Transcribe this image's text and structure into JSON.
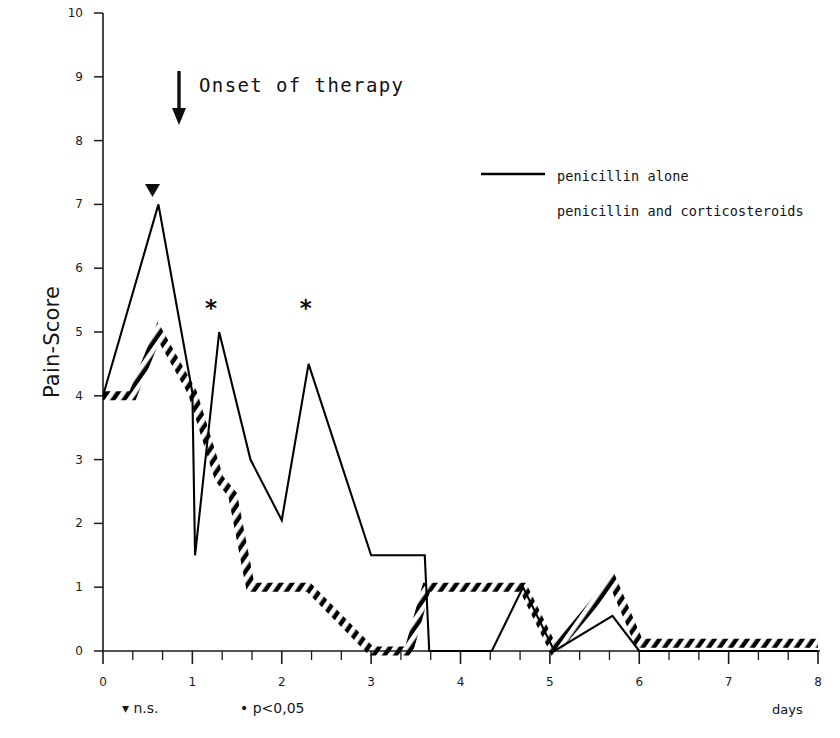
{
  "chart_data": {
    "type": "line",
    "title": "",
    "xlabel": "days",
    "ylabel": "Pain-Score",
    "xlim": [
      0,
      8
    ],
    "ylim": [
      0,
      10
    ],
    "grid": false,
    "legend_position": "upper-right",
    "x_ticks": [
      "0",
      "1",
      "2",
      "3",
      "4",
      "5",
      "6",
      "7",
      "8"
    ],
    "y_ticks": [
      "0",
      "1",
      "2",
      "3",
      "4",
      "5",
      "6",
      "7",
      "8",
      "9",
      "10"
    ],
    "x_minor_ticks_per_interval": 3,
    "series": [
      {
        "name": "penicillin alone",
        "style": "solid",
        "color": "#000000",
        "points": [
          [
            0.0,
            4.0
          ],
          [
            0.62,
            7.0
          ],
          [
            1.0,
            4.05
          ],
          [
            1.03,
            1.5
          ],
          [
            1.3,
            5.0
          ],
          [
            1.65,
            3.0
          ],
          [
            2.0,
            2.05
          ],
          [
            2.3,
            4.5
          ],
          [
            3.0,
            1.5
          ],
          [
            3.6,
            1.5
          ],
          [
            3.65,
            0.0
          ],
          [
            4.35,
            0.0
          ],
          [
            4.7,
            1.0
          ],
          [
            5.05,
            0.0
          ],
          [
            5.7,
            0.55
          ],
          [
            6.0,
            0.0
          ],
          [
            8.0,
            0.0
          ]
        ]
      },
      {
        "name": "penicillin and corticosteroids",
        "style": "hatched-dashed",
        "color": "#000000",
        "points": [
          [
            0.0,
            4.0
          ],
          [
            0.33,
            4.0
          ],
          [
            0.62,
            5.0
          ],
          [
            1.0,
            4.05
          ],
          [
            1.3,
            2.7
          ],
          [
            1.45,
            2.45
          ],
          [
            1.65,
            1.0
          ],
          [
            2.3,
            1.0
          ],
          [
            3.0,
            0.0
          ],
          [
            3.42,
            0.0
          ],
          [
            3.62,
            1.0
          ],
          [
            4.7,
            1.0
          ],
          [
            5.05,
            0.0
          ],
          [
            5.7,
            1.1
          ],
          [
            6.0,
            0.12
          ],
          [
            8.0,
            0.12
          ]
        ]
      }
    ],
    "annotations": [
      {
        "id": "onset",
        "text": "Onset of therapy",
        "icon": "down-arrow-icon",
        "x_day": 0.85,
        "y_score": 9.1
      },
      {
        "id": "ns-marker",
        "symbol": "▼",
        "x_day": 0.55,
        "y_score": 7.3,
        "meaning": "n.s."
      },
      {
        "id": "star-1",
        "symbol": "*",
        "x_day": 1.22,
        "y_score": 5.3,
        "meaning": "p<0,05"
      },
      {
        "id": "star-2",
        "symbol": "*",
        "x_day": 2.28,
        "y_score": 5.3,
        "meaning": "p<0,05"
      }
    ],
    "footnotes": [
      {
        "symbol": "▾",
        "text": "n.s."
      },
      {
        "symbol": "•",
        "text": "p<0,05"
      }
    ]
  },
  "legend": {
    "items": [
      {
        "label": "penicillin alone",
        "style": "solid"
      },
      {
        "label": "penicillin and corticosteroids",
        "style": "hatched-dashed"
      }
    ]
  },
  "axes": {
    "y_title": "Pain-Score",
    "x_title": "days"
  },
  "annotation_onset": {
    "label": "Onset of therapy"
  },
  "footnotes": {
    "ns": "▾ n.s.",
    "pvalue": "• p<0,05"
  },
  "markers": {
    "ns_triangle": "▼",
    "star": "*"
  },
  "colors": {
    "ink": "#000000",
    "axis": "#1a1a1a",
    "background": "#ffffff"
  }
}
